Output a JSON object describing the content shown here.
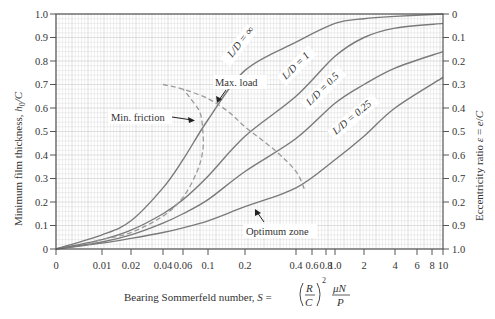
{
  "chart_data": {
    "type": "line",
    "title": "",
    "xlabel": "Bearing Sommerfeld number, S = (R/C)^2 μN/P",
    "xlabel_parts": {
      "prefix": "Bearing Sommerfeld number, ",
      "S": "S",
      "eq": " = ",
      "R": "R",
      "C": "C",
      "exp": "2",
      "mu_n": "μN",
      "P": "P"
    },
    "ylabel": "Minimum film thickness, h0/C",
    "ylabel_parts": {
      "prefix": "Minimum film thickness, ",
      "h": "h",
      "sub": "0",
      "suffix": "/C"
    },
    "y2label": "Eccentricity ratio ε = e/C",
    "y2label_parts": {
      "prefix": "Eccentricity ratio ",
      "eps": "ε",
      "eq": " = ",
      "e": "e",
      "slash": "/",
      "c": "C"
    },
    "xscale": "non-linear (log-like, 0 at origin)",
    "xlim": [
      0,
      10
    ],
    "ylim": [
      0,
      1.0
    ],
    "y2lim": [
      1.0,
      0
    ],
    "grid": true,
    "x_ticks": [
      {
        "v": 0,
        "label": "0",
        "px": 56
      },
      {
        "v": 0.01,
        "label": "0.01",
        "px": 102
      },
      {
        "v": 0.02,
        "label": "0.02",
        "px": 131
      },
      {
        "v": 0.04,
        "label": "0.04",
        "px": 163
      },
      {
        "v": 0.06,
        "label": "0.06",
        "px": 183
      },
      {
        "v": 0.1,
        "label": "0.1",
        "px": 208
      },
      {
        "v": 0.2,
        "label": "0.2",
        "px": 245
      },
      {
        "v": 0.4,
        "label": "0.4",
        "px": 296
      },
      {
        "v": 0.6,
        "label": "0.6",
        "px": 312
      },
      {
        "v": 0.8,
        "label": "0.8",
        "px": 326
      },
      {
        "v": 1.0,
        "label": "1.0",
        "px": 335
      },
      {
        "v": 2,
        "label": "2",
        "px": 364
      },
      {
        "v": 4,
        "label": "4",
        "px": 395
      },
      {
        "v": 6,
        "label": "6",
        "px": 417
      },
      {
        "v": 8,
        "label": "8",
        "px": 432
      },
      {
        "v": 10,
        "label": "10",
        "px": 443
      }
    ],
    "y_ticks": [
      "0",
      "0.1",
      "0.2",
      "0.3",
      "0.4",
      "0.5",
      "0.6",
      "0.7",
      "0.8",
      "0.9",
      "1.0"
    ],
    "y2_ticks": [
      "1.0",
      "0.9",
      "0.2",
      "0.7",
      "0.6",
      "0.5",
      "0.4",
      "0.3",
      "0.2",
      "0.1",
      "0"
    ],
    "series": [
      {
        "name": "L/D = ∞",
        "label": "L/D = ∞",
        "x": [
          0,
          0.01,
          0.02,
          0.04,
          0.06,
          0.1,
          0.2,
          0.4,
          1.0,
          2,
          4,
          10
        ],
        "y": [
          0,
          0.06,
          0.12,
          0.26,
          0.38,
          0.55,
          0.76,
          0.88,
          0.96,
          0.98,
          0.99,
          1.0
        ]
      },
      {
        "name": "L/D = 1",
        "label": "L/D = 1",
        "x": [
          0,
          0.01,
          0.02,
          0.04,
          0.06,
          0.1,
          0.2,
          0.4,
          1.0,
          2,
          4,
          10
        ],
        "y": [
          0,
          0.04,
          0.08,
          0.15,
          0.21,
          0.31,
          0.48,
          0.65,
          0.82,
          0.9,
          0.94,
          0.96
        ]
      },
      {
        "name": "L/D = 0.5",
        "label": "L/D = 0.5",
        "x": [
          0,
          0.01,
          0.02,
          0.04,
          0.06,
          0.1,
          0.2,
          0.4,
          1.0,
          2,
          4,
          10
        ],
        "y": [
          0,
          0.03,
          0.06,
          0.11,
          0.15,
          0.21,
          0.33,
          0.47,
          0.62,
          0.7,
          0.77,
          0.84
        ]
      },
      {
        "name": "L/D = 0.25",
        "label": "L/D = 0.25",
        "x": [
          0,
          0.01,
          0.02,
          0.04,
          0.06,
          0.1,
          0.2,
          0.4,
          1.0,
          2,
          4,
          10
        ],
        "y": [
          0,
          0.025,
          0.045,
          0.07,
          0.09,
          0.12,
          0.18,
          0.26,
          0.38,
          0.48,
          0.6,
          0.73
        ]
      }
    ],
    "dashed_series": [
      {
        "name": "Min. friction",
        "x": [
          0.005,
          0.01,
          0.02,
          0.04,
          0.06,
          0.08,
          0.09,
          0.09,
          0.085,
          0.07,
          0.06
        ],
        "y": [
          0.02,
          0.04,
          0.07,
          0.14,
          0.22,
          0.33,
          0.42,
          0.5,
          0.58,
          0.64,
          0.68
        ]
      },
      {
        "name": "Max. load",
        "x": [
          0.04,
          0.06,
          0.1,
          0.15,
          0.2,
          0.3,
          0.4,
          0.5
        ],
        "y": [
          0.7,
          0.68,
          0.64,
          0.58,
          0.52,
          0.42,
          0.33,
          0.25
        ]
      }
    ],
    "annotations": [
      {
        "text": "Min. friction",
        "x_px": 111,
        "y_px": 120
      },
      {
        "text": "Max. load",
        "x_px": 216,
        "y_px": 86
      },
      {
        "text": "Optimum zone",
        "x_px": 246,
        "y_px": 234
      }
    ]
  },
  "colors": {
    "curve": "#7a7a7a",
    "dashed": "#9a9a9a",
    "grid_minor": "#dcdcdc",
    "grid_major": "#bdbdbd",
    "axis": "#555555",
    "text": "#333333"
  }
}
